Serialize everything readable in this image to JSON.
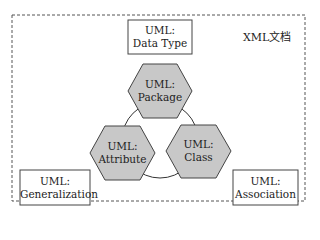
{
  "container": {
    "label": "XML文档"
  },
  "boxes": [
    {
      "id": "data-type",
      "line1": "UML:",
      "line2": "Data Type"
    },
    {
      "id": "generalization",
      "line1": "UML:",
      "line2": "Generalization"
    },
    {
      "id": "association",
      "line1": "UML:",
      "line2": "Association"
    }
  ],
  "hexagons": [
    {
      "id": "package",
      "line1": "UML:",
      "line2": "Package"
    },
    {
      "id": "attribute",
      "line1": "UML:",
      "line2": "Attribute"
    },
    {
      "id": "class",
      "line1": "UML:",
      "line2": "Class"
    }
  ],
  "colors": {
    "hex_fill": "#c8c8c8",
    "stroke": "#444444"
  }
}
